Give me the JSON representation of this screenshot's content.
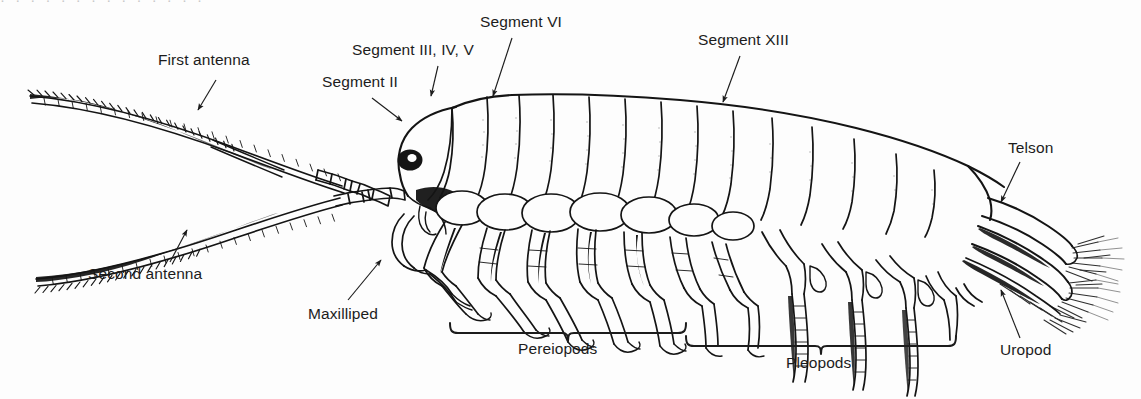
{
  "figure": {
    "domain": "Natural-Image",
    "style": "black-and-white line drawing with leader-line callouts",
    "background_color": "#fdfdfd",
    "ink_color": "#141414",
    "text_color": "#1c1c1c",
    "clipped_top_text": "· · · · · · · · · · · · · ·"
  },
  "labels": [
    {
      "id": "first-antenna",
      "text": "First antenna",
      "x": 158,
      "y": 60,
      "anchor": "start",
      "arrow_from": [
        216,
        80
      ],
      "arrow_to": [
        196,
        112
      ]
    },
    {
      "id": "segment-ii",
      "text": "Segment II",
      "x": 322,
      "y": 82,
      "anchor": "start",
      "arrow_from": [
        372,
        98
      ],
      "arrow_to": [
        404,
        122
      ]
    },
    {
      "id": "segment-iii-iv-v",
      "text": "Segment III, IV, V",
      "x": 352,
      "y": 50,
      "anchor": "start",
      "arrow_from": [
        438,
        66
      ],
      "arrow_to": [
        430,
        98
      ]
    },
    {
      "id": "segment-vi",
      "text": "Segment VI",
      "x": 480,
      "y": 22,
      "anchor": "start",
      "arrow_from": [
        512,
        38
      ],
      "arrow_to": [
        492,
        98
      ]
    },
    {
      "id": "segment-xiii",
      "text": "Segment XIII",
      "x": 698,
      "y": 40,
      "anchor": "start",
      "arrow_from": [
        740,
        56
      ],
      "arrow_to": [
        722,
        104
      ]
    },
    {
      "id": "telson",
      "text": "Telson",
      "x": 1008,
      "y": 148,
      "anchor": "start",
      "arrow_from": [
        1020,
        162
      ],
      "arrow_to": [
        1000,
        204
      ]
    },
    {
      "id": "uropod",
      "text": "Uropod",
      "x": 1000,
      "y": 348,
      "anchor": "start",
      "arrow_from": [
        1020,
        338
      ],
      "arrow_to": [
        1000,
        288
      ]
    },
    {
      "id": "second-antenna",
      "text": "Second antenna",
      "x": 88,
      "y": 273,
      "anchor": "start",
      "arrow_from": [
        170,
        262
      ],
      "arrow_to": [
        188,
        228
      ]
    },
    {
      "id": "maxilliped",
      "text": "Maxilliped",
      "x": 308,
      "y": 313,
      "anchor": "start",
      "arrow_from": [
        348,
        300
      ],
      "arrow_to": [
        382,
        258
      ]
    }
  ],
  "braces": [
    {
      "id": "pereiopods",
      "text": "Pereiopods",
      "left_x": 450,
      "right_x": 686,
      "y": 333,
      "label_x": 568,
      "label_y": 348
    },
    {
      "id": "pleopods",
      "text": "Pleopods",
      "left_x": 686,
      "right_x": 956,
      "y": 346,
      "label_x": 821,
      "label_y": 362
    }
  ],
  "anatomy": {
    "body_segment_count": 13,
    "coxal_plate_count": 7,
    "pereiopod_count": 7,
    "pleopod_count": 5,
    "antenna_count": 2,
    "eye": "dark pigmented compound eye",
    "tail": "telson with uropods bearing setal brushes"
  }
}
